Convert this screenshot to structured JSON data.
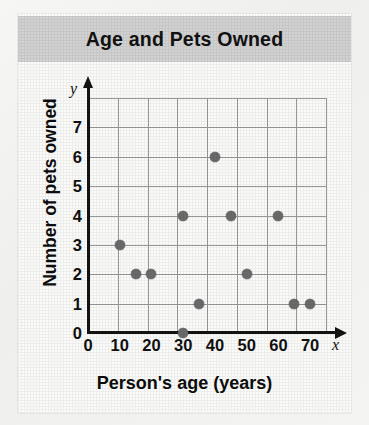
{
  "title": "Age and Pets Owned",
  "chart_data": {
    "type": "scatter",
    "title": "Age and Pets Owned",
    "xlabel": "Person's age (years)",
    "ylabel": "Number of pets owned",
    "x_axis_variable": "x",
    "y_axis_variable": "y",
    "xlim": [
      0,
      75
    ],
    "ylim": [
      0,
      8
    ],
    "xticks": [
      0,
      10,
      20,
      30,
      40,
      50,
      60,
      70
    ],
    "xtick_labels": [
      "0",
      "10",
      "20",
      "30",
      "40",
      "50",
      "60",
      "70"
    ],
    "yticks": [
      0,
      1,
      2,
      3,
      4,
      5,
      6,
      7
    ],
    "ytick_labels": [
      "0",
      "1",
      "2",
      "3",
      "4",
      "5",
      "6",
      "7"
    ],
    "grid": true,
    "legend": false,
    "point_color": "#6b6b6b",
    "points": [
      {
        "x": 10,
        "y": 3
      },
      {
        "x": 15,
        "y": 2
      },
      {
        "x": 20,
        "y": 2
      },
      {
        "x": 30,
        "y": 4
      },
      {
        "x": 30,
        "y": 0
      },
      {
        "x": 35,
        "y": 1
      },
      {
        "x": 40,
        "y": 6
      },
      {
        "x": 45,
        "y": 4
      },
      {
        "x": 50,
        "y": 2
      },
      {
        "x": 60,
        "y": 4
      },
      {
        "x": 65,
        "y": 1
      },
      {
        "x": 70,
        "y": 1
      }
    ]
  },
  "colors": {
    "title_band": "#d2d2d2",
    "grid": "#9a9a9a",
    "axis": "#141414",
    "point": "#6b6b6b",
    "card": "#fbfbfa"
  }
}
